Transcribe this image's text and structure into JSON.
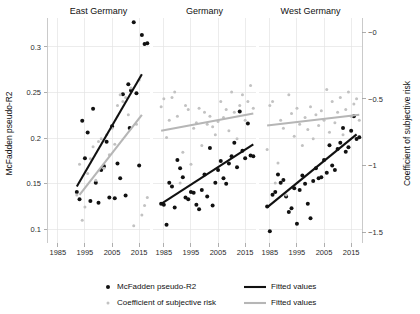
{
  "chart_data": {
    "type": "scatter",
    "title": "",
    "xlabel": "",
    "ylabel": "McFadden pseudo-R2",
    "y2label": "Coefficient of subjective risk",
    "xlim": [
      1981,
      2019
    ],
    "ylim": [
      0.085,
      0.325
    ],
    "y2lim": [
      -1.58,
      0.06
    ],
    "xticks": [
      1985,
      1995,
      2005,
      2015
    ],
    "yticks": [
      0.1,
      0.15,
      0.2,
      0.25,
      0.3
    ],
    "y2ticks": [
      -1.5,
      -1,
      -0.5,
      0
    ],
    "ytick_labels": [
      "0.1",
      "0.15",
      "0.2",
      "0.25",
      "0.3"
    ],
    "y2tick_labels": [
      "−1.5",
      "−1",
      "−0.5",
      "−0"
    ],
    "xtick_labels": [
      "1985",
      "1995",
      "2005",
      "2015"
    ],
    "grid": true,
    "y2_axis_inverted": true,
    "legend_position": "bottom",
    "colors": {
      "dark": "#111111",
      "light": "#c2c2c2",
      "grid": "#e4e4e4",
      "axis": "#bdbdbd"
    },
    "panels": [
      {
        "name": "East Germany",
        "series": [
          {
            "name": "McFadden pseudo-R2",
            "axis": "left",
            "marker": "dark",
            "points": [
              [
                1992,
                0.141
              ],
              [
                1993,
                0.133
              ],
              [
                1994,
                0.219
              ],
              [
                1995,
                0.178
              ],
              [
                1996,
                0.206
              ],
              [
                1997,
                0.131
              ],
              [
                1998,
                0.232
              ],
              [
                1999,
                0.151
              ],
              [
                2000,
                0.129
              ],
              [
                2001,
                0.165
              ],
              [
                2002,
                0.169
              ],
              [
                2003,
                0.196
              ],
              [
                2004,
                0.135
              ],
              [
                2005,
                0.213
              ],
              [
                2006,
                0.134
              ],
              [
                2007,
                0.172
              ],
              [
                2008,
                0.156
              ],
              [
                2009,
                0.248
              ],
              [
                2010,
                0.137
              ],
              [
                2011,
                0.259
              ],
              [
                2012,
                0.252
              ],
              [
                2013,
                0.327
              ],
              [
                2014,
                0.249
              ],
              [
                2015,
                0.17
              ],
              [
                2016,
                0.313
              ],
              [
                2017,
                0.303
              ],
              [
                2018,
                0.304
              ],
              [
                2011.5,
                0.211
              ]
            ]
          },
          {
            "name": "Coefficient of subjective risk",
            "axis": "right",
            "marker": "light",
            "points": [
              [
                1992,
                -1.22
              ],
              [
                1993,
                -0.99
              ],
              [
                1994,
                -1.41
              ],
              [
                1995,
                -1.31
              ],
              [
                1996,
                -1.06
              ],
              [
                1997,
                -0.95
              ],
              [
                1998,
                -0.86
              ],
              [
                1999,
                -1.11
              ],
              [
                2000,
                -0.82
              ],
              [
                2001,
                -0.8
              ],
              [
                2002,
                -1.02
              ],
              [
                2003,
                -0.77
              ],
              [
                2004,
                -0.92
              ],
              [
                2005,
                -0.72
              ],
              [
                2006,
                -0.84
              ],
              [
                2007,
                -0.55
              ],
              [
                2008,
                -0.47
              ],
              [
                2009,
                -0.52
              ],
              [
                2010,
                -0.49
              ],
              [
                2011,
                -0.62
              ],
              [
                2012,
                -0.42
              ],
              [
                2013,
                -1.45
              ],
              [
                2014,
                -0.69
              ],
              [
                2015,
                -0.36
              ],
              [
                2016,
                -1.37
              ],
              [
                2017,
                -1.3
              ],
              [
                2018,
                -1.24
              ]
            ]
          }
        ],
        "fits": [
          {
            "name": "Fitted values",
            "style": "dark",
            "x": [
              1992,
              2016
            ],
            "y": [
              0.147,
              0.27
            ]
          },
          {
            "name": "Fitted values",
            "style": "light",
            "x": [
              1993,
              2016
            ],
            "y": [
              -1.22,
              -0.62
            ]
          }
        ]
      },
      {
        "name": "Germany",
        "series": [
          {
            "name": "McFadden pseudo-R2",
            "axis": "left",
            "marker": "dark",
            "points": [
              [
                1984,
                0.128
              ],
              [
                1985,
                0.127
              ],
              [
                1986,
                0.105
              ],
              [
                1987,
                0.151
              ],
              [
                1988,
                0.147
              ],
              [
                1989,
                0.124
              ],
              [
                1990,
                0.176
              ],
              [
                1991,
                0.167
              ],
              [
                1992,
                0.157
              ],
              [
                1993,
                0.135
              ],
              [
                1994,
                0.133
              ],
              [
                1995,
                0.141
              ],
              [
                1996,
                0.14
              ],
              [
                1997,
                0.127
              ],
              [
                1998,
                0.122
              ],
              [
                1999,
                0.143
              ],
              [
                2000,
                0.16
              ],
              [
                2001,
                0.136
              ],
              [
                2002,
                0.189
              ],
              [
                2003,
                0.126
              ],
              [
                2004,
                0.151
              ],
              [
                2005,
                0.165
              ],
              [
                2006,
                0.175
              ],
              [
                2007,
                0.156
              ],
              [
                2008,
                0.15
              ],
              [
                2009,
                0.172
              ],
              [
                2010,
                0.18
              ],
              [
                2011,
                0.195
              ],
              [
                2012,
                0.168
              ],
              [
                2013,
                0.229
              ],
              [
                2014,
                0.186
              ],
              [
                2015,
                0.178
              ],
              [
                2016,
                0.216
              ],
              [
                2017,
                0.181
              ],
              [
                2018,
                0.18
              ]
            ]
          },
          {
            "name": "Coefficient of subjective risk",
            "axis": "right",
            "marker": "light",
            "points": [
              [
                1984,
                -0.56
              ],
              [
                1985,
                -0.5
              ],
              [
                1986,
                -0.79
              ],
              [
                1987,
                -0.66
              ],
              [
                1988,
                -0.49
              ],
              [
                1989,
                -0.45
              ],
              [
                1990,
                -0.63
              ],
              [
                1991,
                -1.13
              ],
              [
                1992,
                -0.9
              ],
              [
                1993,
                -0.55
              ],
              [
                1994,
                -0.58
              ],
              [
                1995,
                -0.99
              ],
              [
                1996,
                -0.72
              ],
              [
                1997,
                -0.68
              ],
              [
                1998,
                -0.57
              ],
              [
                1999,
                -0.85
              ],
              [
                2000,
                -0.6
              ],
              [
                2001,
                -0.69
              ],
              [
                2002,
                -0.63
              ],
              [
                2003,
                -0.71
              ],
              [
                2004,
                -0.77
              ],
              [
                2005,
                -0.67
              ],
              [
                2006,
                -0.52
              ],
              [
                2007,
                -0.64
              ],
              [
                2008,
                -0.58
              ],
              [
                2009,
                -0.74
              ],
              [
                2010,
                -0.45
              ],
              [
                2011,
                -0.6
              ],
              [
                2012,
                -0.8
              ],
              [
                2013,
                -0.55
              ],
              [
                2014,
                -0.47
              ],
              [
                2015,
                -0.66
              ],
              [
                2016,
                -0.52
              ],
              [
                2017,
                -0.4
              ],
              [
                2018,
                -0.57
              ]
            ]
          }
        ],
        "fits": [
          {
            "name": "Fitted values",
            "style": "dark",
            "x": [
              1984,
              2018
            ],
            "y": [
              0.128,
              0.193
            ]
          },
          {
            "name": "Fitted values",
            "style": "light",
            "x": [
              1984,
              2018
            ],
            "y": [
              -0.74,
              -0.61
            ]
          }
        ]
      },
      {
        "name": "West Germany",
        "series": [
          {
            "name": "McFadden pseudo-R2",
            "axis": "left",
            "marker": "dark",
            "points": [
              [
                1984,
                0.125
              ],
              [
                1985,
                0.098
              ],
              [
                1986,
                0.138
              ],
              [
                1987,
                0.141
              ],
              [
                1988,
                0.16
              ],
              [
                1989,
                0.151
              ],
              [
                1990,
                0.154
              ],
              [
                1991,
                0.136
              ],
              [
                1992,
                0.119
              ],
              [
                1993,
                0.123
              ],
              [
                1994,
                0.145
              ],
              [
                1995,
                0.106
              ],
              [
                1996,
                0.143
              ],
              [
                1997,
                0.159
              ],
              [
                1998,
                0.15
              ],
              [
                1999,
                0.128
              ],
              [
                2000,
                0.112
              ],
              [
                2001,
                0.153
              ],
              [
                2002,
                0.167
              ],
              [
                2003,
                0.156
              ],
              [
                2004,
                0.157
              ],
              [
                2005,
                0.176
              ],
              [
                2006,
                0.162
              ],
              [
                2007,
                0.192
              ],
              [
                2008,
                0.17
              ],
              [
                2009,
                0.165
              ],
              [
                2010,
                0.188
              ],
              [
                2011,
                0.195
              ],
              [
                2012,
                0.211
              ],
              [
                2013,
                0.185
              ],
              [
                2014,
                0.19
              ],
              [
                2015,
                0.208
              ],
              [
                2016,
                0.224
              ],
              [
                2017,
                0.199
              ],
              [
                2018,
                0.201
              ]
            ]
          },
          {
            "name": "Coefficient of subjective risk",
            "axis": "right",
            "marker": "light",
            "points": [
              [
                1984,
                -0.88
              ],
              [
                1985,
                -0.55
              ],
              [
                1986,
                -0.52
              ],
              [
                1987,
                -1.13
              ],
              [
                1988,
                -0.98
              ],
              [
                1989,
                -0.66
              ],
              [
                1990,
                -0.72
              ],
              [
                1991,
                -1.22
              ],
              [
                1992,
                -0.47
              ],
              [
                1993,
                -0.61
              ],
              [
                1994,
                -0.78
              ],
              [
                1995,
                -0.57
              ],
              [
                1996,
                -0.69
              ],
              [
                1997,
                -0.85
              ],
              [
                1998,
                -0.64
              ],
              [
                1999,
                -0.73
              ],
              [
                2000,
                -0.56
              ],
              [
                2001,
                -0.8
              ],
              [
                2002,
                -0.62
              ],
              [
                2003,
                -0.7
              ],
              [
                2004,
                -0.59
              ],
              [
                2005,
                -0.66
              ],
              [
                2006,
                -0.43
              ],
              [
                2007,
                -0.75
              ],
              [
                2008,
                -0.52
              ],
              [
                2009,
                -0.68
              ],
              [
                2010,
                -0.6
              ],
              [
                2011,
                -0.49
              ],
              [
                2012,
                -0.77
              ],
              [
                2013,
                -0.58
              ],
              [
                2014,
                -0.45
              ],
              [
                2015,
                -0.63
              ],
              [
                2016,
                -0.54
              ],
              [
                2017,
                -0.5
              ],
              [
                2018,
                -0.66
              ]
            ]
          }
        ],
        "fits": [
          {
            "name": "Fitted values",
            "style": "dark",
            "x": [
              1984,
              2017
            ],
            "y": [
              0.124,
              0.204
            ]
          },
          {
            "name": "Fitted values",
            "style": "light",
            "x": [
              1984,
              2018
            ],
            "y": [
              -0.7,
              -0.62
            ]
          }
        ]
      }
    ],
    "legend": [
      {
        "label": "McFadden pseudo-R2",
        "marker": "dot",
        "style": "dark"
      },
      {
        "label": "Coefficient of subjective risk",
        "marker": "dot",
        "style": "light"
      },
      {
        "label": "Fitted values",
        "marker": "line",
        "style": "dark"
      },
      {
        "label": "Fitted values",
        "marker": "line",
        "style": "light"
      }
    ]
  }
}
